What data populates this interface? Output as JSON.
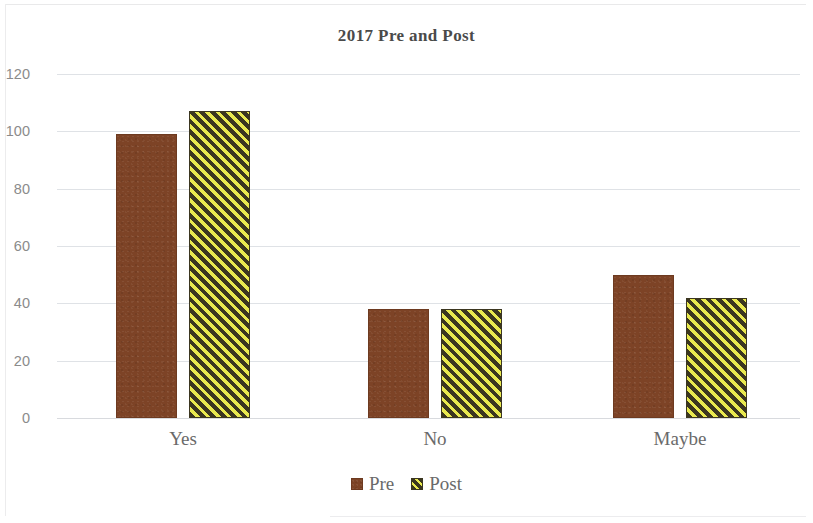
{
  "chart_data": {
    "type": "bar",
    "title": "2017 Pre and Post",
    "xlabel": "",
    "ylabel": "",
    "categories": [
      "Yes",
      "No",
      "Maybe"
    ],
    "series": [
      {
        "name": "Pre",
        "color": "#7d4326",
        "fill": "solid-brown",
        "values": [
          99,
          38,
          50
        ]
      },
      {
        "name": "Post",
        "color": "#e9e94f",
        "fill": "yellow-black-diagonal-stripes",
        "values": [
          107,
          38,
          42
        ]
      }
    ],
    "ylim": [
      0,
      120
    ],
    "yticks": [
      0,
      20,
      40,
      60,
      80,
      100,
      120
    ],
    "ytick_labels": [
      "0",
      "20",
      "40",
      "60",
      "80",
      "100",
      "120"
    ],
    "grid": true,
    "grid_axis": "y",
    "legend_position": "bottom",
    "colors": {
      "pre": "#7d4326",
      "post_yellow": "#e9e94f",
      "post_dark": "#3b3620",
      "gridline": "#dfe2e6",
      "title_text": "#4a4a4a",
      "tick_text": "#8b8b8b",
      "label_text": "#6a6a6a"
    }
  },
  "legend": {
    "items": [
      {
        "label": "Pre",
        "swatch": "brown-square-icon"
      },
      {
        "label": "Post",
        "swatch": "striped-square-icon"
      }
    ]
  }
}
